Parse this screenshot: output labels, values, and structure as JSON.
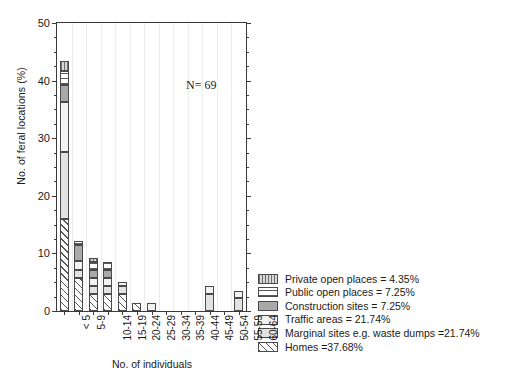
{
  "chart_data": {
    "type": "bar",
    "subtype": "stacked-bar",
    "title": "",
    "xlabel": "No. of individuals",
    "ylabel": "No. of feral locations (%)",
    "ylim": [
      0,
      50
    ],
    "yticks": [
      0,
      10,
      20,
      30,
      40,
      50
    ],
    "ytick_labels": [
      "0",
      "10",
      "20",
      "30",
      "40",
      "50"
    ],
    "y_minor_tick_interval": 2.5,
    "grid": "faint vertical gridlines only",
    "legend_position": "right-bottom, outside axes",
    "annotations": [
      {
        "text": "N= 69",
        "x_category": "35-39",
        "y_value": 33.5
      }
    ],
    "categories": [
      "< 5",
      "5-9",
      "10-14",
      "15-19",
      "20-24",
      "25-29",
      "30-34",
      "35-39",
      "40-44",
      "45-49",
      "50-54",
      "55-59",
      "60-64"
    ],
    "series": [
      {
        "name": "Homes",
        "pattern": "diagonal-hatch",
        "values": [
          16.0,
          5.8,
          2.9,
          2.9,
          2.9,
          1.4,
          0.0,
          0.0,
          0.0,
          0.0,
          0.0,
          0.0,
          0.0
        ]
      },
      {
        "name": "Marginal sites e.g. waste dumps",
        "pattern": "light-gray-solid",
        "values": [
          11.6,
          1.4,
          1.4,
          1.4,
          1.4,
          0.0,
          0.0,
          0.0,
          0.0,
          0.0,
          2.9,
          0.0,
          2.2
        ]
      },
      {
        "name": "Traffic areas",
        "pattern": "very-light-solid",
        "values": [
          8.7,
          1.4,
          1.4,
          1.4,
          0.7,
          0.0,
          1.4,
          0.0,
          0.0,
          0.0,
          1.4,
          0.0,
          1.2
        ]
      },
      {
        "name": "Construction sites",
        "pattern": "mid-gray-solid",
        "values": [
          3.0,
          2.9,
          1.4,
          1.4,
          0.0,
          0.0,
          0.0,
          0.0,
          0.0,
          0.0,
          0.0,
          0.0,
          0.0
        ]
      },
      {
        "name": "Public open places",
        "pattern": "horizontal-stripes",
        "values": [
          2.3,
          0.7,
          1.4,
          1.4,
          0.0,
          0.0,
          0.0,
          0.0,
          0.0,
          0.0,
          0.0,
          0.0,
          0.0
        ]
      },
      {
        "name": "Private open places",
        "pattern": "vertical-stripes",
        "values": [
          1.8,
          0.0,
          0.7,
          0.0,
          0.0,
          0.0,
          0.0,
          0.0,
          0.0,
          0.0,
          0.0,
          0.0,
          0.0
        ]
      }
    ],
    "totals": [
      43.4,
      12.2,
      9.2,
      8.5,
      5.0,
      1.4,
      1.4,
      0.0,
      0.0,
      0.0,
      4.3,
      0.0,
      3.4
    ]
  },
  "axes": {
    "ylabel": "No. of feral locations (%)",
    "xlabel": "No. of individuals",
    "ytick_labels": [
      "0",
      "10",
      "20",
      "30",
      "40",
      "50"
    ],
    "xtick_labels": [
      "< 5",
      "5-9",
      "10-14",
      "15-19",
      "20-24",
      "25-29",
      "30-34",
      "35-39",
      "40-44",
      "45-49",
      "50-54",
      "55-59",
      "60-64"
    ]
  },
  "annotation": {
    "sample_size": "N= 69"
  },
  "legend": {
    "items": [
      {
        "label": "Private open places = 4.35%",
        "key": "private",
        "value": 4.35
      },
      {
        "label": "Public open places = 7.25%",
        "key": "public",
        "value": 7.25
      },
      {
        "label": "Construction sites = 7.25%",
        "key": "construction",
        "value": 7.25
      },
      {
        "label": "Traffic areas = 21.74%",
        "key": "traffic",
        "value": 21.74
      },
      {
        "label": "Marginal sites e.g. waste dumps =21.74%",
        "key": "marginal",
        "value": 21.74
      },
      {
        "label": "Homes =37.68%",
        "key": "homes",
        "value": 37.68
      }
    ]
  },
  "colors": {
    "axis": "#3a3a3a",
    "text": "#1a1a1a",
    "grid": "#ededed",
    "background": "#ffffff",
    "private": "#d7d7d7",
    "public": "#ffffff",
    "construction": "#a9a9a9",
    "traffic": "#f2f2f2",
    "marginal": "#e2e2e2",
    "homes": "#ffffff"
  }
}
